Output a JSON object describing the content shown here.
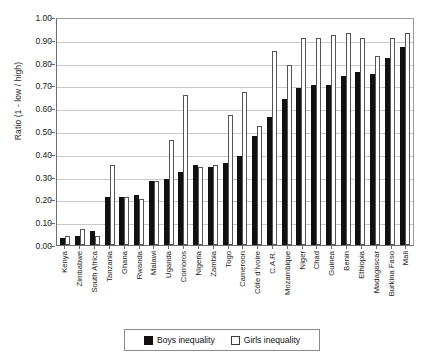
{
  "chart_data": {
    "type": "bar",
    "title": "",
    "xlabel": "",
    "ylabel": "Ratio (1 - low / high)",
    "ylim": [
      0,
      1.0
    ],
    "ytick_labels": [
      "1.00",
      "0.90",
      "0.80",
      "0.70",
      "0.60",
      "0.50",
      "0.40",
      "0.30",
      "0.20",
      "0.10",
      "0.00"
    ],
    "ytick_values": [
      1.0,
      0.9,
      0.8,
      0.7,
      0.6,
      0.5,
      0.4,
      0.3,
      0.2,
      0.1,
      0.0
    ],
    "grid": true,
    "legend_position": "bottom",
    "categories": [
      "Kenya",
      "Zimbabwe",
      "South Africa",
      "Tanzania",
      "Ghana",
      "Rwanda",
      "Malawi",
      "Uganda",
      "Comoros",
      "Nigeria",
      "Zambia",
      "Togo",
      "Cameroon",
      "Côte d'Ivoire",
      "C.A.R.",
      "Mozambique",
      "Niger",
      "Chad",
      "Guinea",
      "Benin",
      "Ethiopia",
      "Madagascar",
      "Burkina Faso",
      "Mali"
    ],
    "series": [
      {
        "name": "Boys inequality",
        "color": "#111111",
        "values": [
          0.03,
          0.04,
          0.06,
          0.21,
          0.21,
          0.22,
          0.28,
          0.29,
          0.32,
          0.35,
          0.34,
          0.36,
          0.39,
          0.48,
          0.56,
          0.64,
          0.69,
          0.7,
          0.7,
          0.74,
          0.76,
          0.75,
          0.82,
          0.87
        ]
      },
      {
        "name": "Girls inequality",
        "color": "#ffffff",
        "values": [
          0.04,
          0.07,
          0.04,
          0.35,
          0.21,
          0.2,
          0.28,
          0.46,
          0.66,
          0.34,
          0.35,
          0.57,
          0.67,
          0.52,
          0.85,
          0.79,
          0.91,
          0.91,
          0.92,
          0.93,
          0.91,
          0.83,
          0.91,
          0.93
        ]
      }
    ]
  },
  "legend": {
    "items": [
      {
        "label": "Boys inequality",
        "swatch": "filled-black-square"
      },
      {
        "label": "Girls inequality",
        "swatch": "open-white-square"
      }
    ]
  },
  "colors": {
    "boys": "#111111",
    "girls": "#ffffff",
    "girls_border": "#555555",
    "grid": "#c9c9c9",
    "axis": "#6e6e6e",
    "background": "#ffffff"
  }
}
